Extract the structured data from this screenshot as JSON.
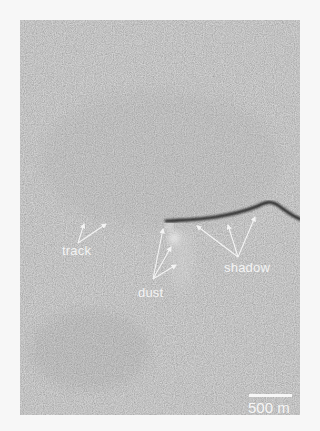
{
  "figure": {
    "background_color": "#8b8b8b",
    "page_color": "#f7f7f7"
  },
  "labels": {
    "track": "track",
    "dust": "dust",
    "shadow": "shadow"
  },
  "scale_bar": {
    "label": "500 m",
    "color": "#f6f6f6"
  },
  "annotation_color": "#f4f4f4"
}
